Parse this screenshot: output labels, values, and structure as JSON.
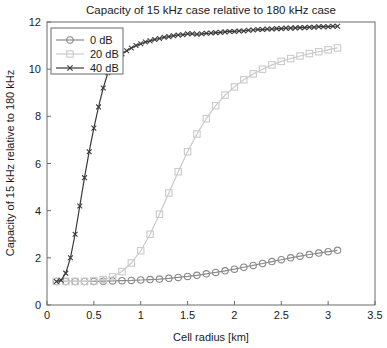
{
  "chart_data": {
    "type": "line",
    "title": "Capacity of 15 kHz case relative to 180 kHz case",
    "xlabel": "Cell radius [km]",
    "ylabel": "Capacity of 15 kHz relative to 180 kHz",
    "xlim": [
      0,
      3.5
    ],
    "ylim": [
      0,
      12
    ],
    "xticks": [
      0,
      0.5,
      1,
      1.5,
      2,
      2.5,
      3,
      3.5
    ],
    "xticklabels": [
      "0",
      "0.5",
      "1",
      "1.5",
      "2",
      "2.5",
      "3",
      "3.5"
    ],
    "yticks": [
      0,
      2,
      4,
      6,
      8,
      10,
      12
    ],
    "yticklabels": [
      "0",
      "2",
      "4",
      "6",
      "8",
      "10",
      "12"
    ],
    "grid": false,
    "legend_position": "upper left",
    "series": [
      {
        "name": "0 dB",
        "color": "#8a8a8a",
        "marker": "circle",
        "x": [
          0.1,
          0.2,
          0.3,
          0.4,
          0.5,
          0.6,
          0.7,
          0.8,
          0.9,
          1.0,
          1.1,
          1.2,
          1.3,
          1.4,
          1.5,
          1.6,
          1.7,
          1.8,
          1.9,
          2.0,
          2.1,
          2.2,
          2.3,
          2.4,
          2.5,
          2.6,
          2.7,
          2.8,
          2.9,
          3.0,
          3.1
        ],
        "y": [
          1.0,
          1.0,
          1.0,
          1.0,
          1.0,
          1.01,
          1.02,
          1.03,
          1.04,
          1.06,
          1.08,
          1.1,
          1.13,
          1.17,
          1.21,
          1.26,
          1.32,
          1.38,
          1.45,
          1.52,
          1.6,
          1.68,
          1.76,
          1.84,
          1.92,
          2.0,
          2.07,
          2.14,
          2.2,
          2.26,
          2.32
        ]
      },
      {
        "name": "20 dB",
        "color": "#cacaca",
        "marker": "square",
        "x": [
          0.1,
          0.2,
          0.3,
          0.4,
          0.5,
          0.6,
          0.7,
          0.8,
          0.9,
          1.0,
          1.1,
          1.2,
          1.3,
          1.4,
          1.5,
          1.6,
          1.7,
          1.8,
          1.9,
          2.0,
          2.1,
          2.2,
          2.3,
          2.4,
          2.5,
          2.6,
          2.7,
          2.8,
          2.9,
          3.0,
          3.1
        ],
        "y": [
          1.0,
          1.0,
          1.0,
          1.0,
          1.02,
          1.08,
          1.2,
          1.42,
          1.78,
          2.3,
          3.0,
          3.85,
          4.75,
          5.65,
          6.5,
          7.25,
          7.9,
          8.45,
          8.9,
          9.25,
          9.55,
          9.8,
          10.0,
          10.18,
          10.33,
          10.45,
          10.56,
          10.66,
          10.74,
          10.82,
          10.9
        ]
      },
      {
        "name": "40 dB",
        "color": "#3a3a3a",
        "marker": "x",
        "x": [
          0.1,
          0.15,
          0.2,
          0.25,
          0.3,
          0.35,
          0.4,
          0.45,
          0.5,
          0.55,
          0.6,
          0.65,
          0.7,
          0.75,
          0.8,
          0.85,
          0.9,
          0.95,
          1.0,
          1.05,
          1.1,
          1.15,
          1.2,
          1.25,
          1.3,
          1.35,
          1.4,
          1.45,
          1.5,
          1.55,
          1.6,
          1.65,
          1.7,
          1.75,
          1.8,
          1.85,
          1.9,
          1.95,
          2.0,
          2.05,
          2.1,
          2.15,
          2.2,
          2.25,
          2.3,
          2.35,
          2.4,
          2.45,
          2.5,
          2.55,
          2.6,
          2.65,
          2.7,
          2.75,
          2.8,
          2.85,
          2.9,
          2.95,
          3.0,
          3.05,
          3.1
        ],
        "y": [
          1.0,
          1.05,
          1.35,
          2.0,
          3.0,
          4.2,
          5.4,
          6.5,
          7.5,
          8.4,
          9.2,
          9.85,
          10.3,
          10.5,
          10.65,
          10.78,
          10.9,
          11.0,
          11.08,
          11.15,
          11.2,
          11.26,
          11.3,
          11.35,
          11.38,
          11.42,
          11.45,
          11.46,
          11.5,
          11.5,
          11.48,
          11.5,
          11.52,
          11.53,
          11.55,
          11.56,
          11.58,
          11.6,
          11.6,
          11.62,
          11.62,
          11.65,
          11.66,
          11.68,
          11.68,
          11.7,
          11.7,
          11.72,
          11.72,
          11.74,
          11.74,
          11.75,
          11.76,
          11.76,
          11.78,
          11.78,
          11.8,
          11.8,
          11.8,
          11.82,
          11.82
        ]
      }
    ]
  }
}
